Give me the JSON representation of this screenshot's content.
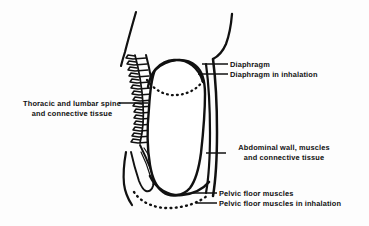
{
  "diagram": {
    "background_color": "#fdfdfd",
    "ink_color": "#111111",
    "labels": {
      "spine_line1": "Thoracic and lumbar spine",
      "spine_line2": "and connective tissue",
      "diaphragm": "Diaphragm",
      "diaphragm_inhalation": "Diaphragm in inhalation",
      "abdominal_line1": "Abdominal wall, muscles",
      "abdominal_line2": "and connective tissue",
      "pelvic_floor": "Pelvic floor muscles",
      "pelvic_floor_inhalation": "Pelvic floor muscles in inhalation"
    },
    "parts": {
      "spine_name": "vertebral-column",
      "diaphragm_rest_name": "diaphragm-at-rest-dome",
      "diaphragm_inhalation_name": "diaphragm-in-inhalation-dotted",
      "abdominal_wall_name": "abdominal-wall-outline",
      "pelvic_floor_rest_name": "pelvic-floor-at-rest",
      "pelvic_floor_inhalation_name": "pelvic-floor-in-inhalation-dotted",
      "sacrum_name": "sacrum-coccyx",
      "ribcage_name": "ribcage-curve",
      "abdominal_cavity_name": "abdominal-cavity"
    },
    "vertebrae_count": 14
  }
}
